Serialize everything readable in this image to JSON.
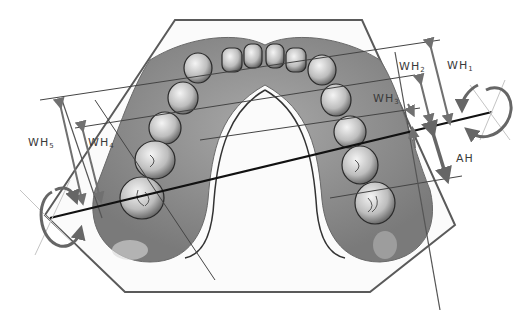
{
  "figure": {
    "outline_shape": "hexagon",
    "colors": {
      "outline": "#5a5a5a",
      "gum": "#8a8a8a",
      "teeth": "#e0e0e0",
      "measure_lines": "#444444",
      "axis_line": "#111111",
      "arrows": "#707070",
      "rotation_arrows": "#666666",
      "guide_lines": "#bdbdbd"
    }
  },
  "labels": {
    "wh1": {
      "base": "WH",
      "sub": "1"
    },
    "wh2": {
      "base": "WH",
      "sub": "2"
    },
    "wh3": {
      "base": "WH",
      "sub": "3"
    },
    "wh4": {
      "base": "WH",
      "sub": "4"
    },
    "wh5": {
      "base": "WH",
      "sub": "5"
    },
    "ah": {
      "base": "AH"
    }
  },
  "annotations": [
    {
      "id": "WH1",
      "type": "height-arrow",
      "side": "right"
    },
    {
      "id": "WH2",
      "type": "height-arrow",
      "side": "right"
    },
    {
      "id": "WH3",
      "type": "height-arrow",
      "side": "right"
    },
    {
      "id": "WH4",
      "type": "height-arrow",
      "side": "left"
    },
    {
      "id": "WH5",
      "type": "height-arrow",
      "side": "left"
    },
    {
      "id": "AH",
      "type": "double-arrow",
      "side": "right"
    },
    {
      "id": "rotation-left",
      "type": "curved-arrow"
    },
    {
      "id": "rotation-right",
      "type": "curved-arrow"
    }
  ]
}
